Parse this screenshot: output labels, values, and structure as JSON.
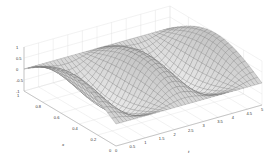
{
  "chart_data": {
    "type": "surface",
    "title": "",
    "xlabel": "t",
    "ylabel": "x",
    "zlabel": "",
    "x_ticks": [
      "0",
      "0.5",
      "1",
      "1.5",
      "2",
      "2.5",
      "3",
      "3.5",
      "4",
      "4.5",
      "5"
    ],
    "y_ticks": [
      "0",
      "0.2",
      "0.4",
      "0.6",
      "0.8",
      "1"
    ],
    "z_ticks": [
      "-1",
      "-0.5",
      "0",
      "0.5",
      "1"
    ],
    "xlim": [
      0,
      5
    ],
    "ylim": [
      0,
      1
    ],
    "zlim": [
      -1,
      1
    ],
    "grid": true,
    "colormap": "gray",
    "surface_function": "z = sin(pi*x) * cos(2*pi*t/2.5 ... ) (standing wave, 2 full periods in t, half period in x)",
    "peaks_count_back_row": 3,
    "peaks_count_front_row": 2,
    "mesh": {
      "nx": 40,
      "ny": 22
    }
  },
  "colors": {
    "background": "#ffffff",
    "mesh_line": "#555555",
    "axis_line": "#999999",
    "grid_line": "#dddddd"
  }
}
